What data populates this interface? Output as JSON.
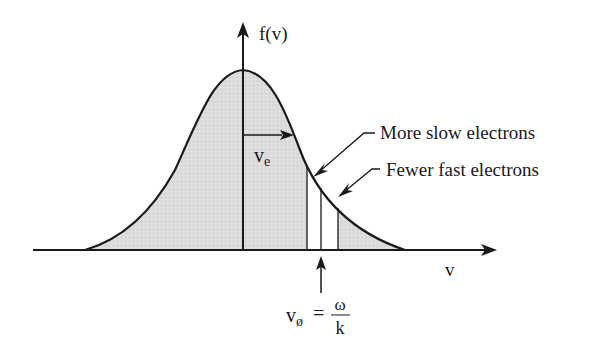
{
  "diagram": {
    "y_axis_label": "f(v)",
    "x_axis_label": "v",
    "thermal_velocity_label": {
      "main": "v",
      "sub": "e"
    },
    "phase_velocity_label": {
      "main": "v",
      "sub": "ø",
      "equals": "=",
      "numerator": "ω",
      "denominator": "k"
    },
    "annotations": [
      {
        "text": "More slow electrons"
      },
      {
        "text": "Fewer fast electrons"
      }
    ],
    "colors": {
      "fill": "#d9d9d9",
      "stroke": "#1a1a1a",
      "background": "#ffffff"
    }
  }
}
